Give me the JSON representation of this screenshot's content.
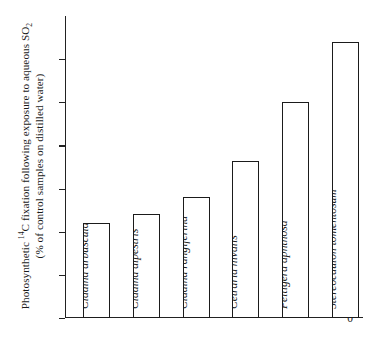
{
  "chart_data": {
    "type": "bar",
    "title": "",
    "xlabel": "",
    "ylabel_line1_prefix": "Photosynthetic ",
    "ylabel_line1_sup": "14",
    "ylabel_line1_mid": "C fixation following exposure to aqueous SO",
    "ylabel_line1_sub": "2",
    "ylabel_line2": "(% of control samples on distilled water)",
    "ylabel_plain": "Photosynthetic 14C fixation following exposure to aqueous SO2 (% of control samples on distilled water)",
    "categories": [
      "Cladina arbuscula",
      "Cladina alpestris",
      "Cladina rangiferina",
      "Cetraria nivalis",
      "Peltigera aphthosa",
      "Stereocaulon tomentosum"
    ],
    "values": [
      44,
      48,
      56,
      73,
      100,
      128
    ],
    "ylim": [
      0,
      140
    ],
    "yticks": [
      0,
      20,
      40,
      60,
      80,
      100,
      120
    ],
    "ytick_labels": [
      "0",
      "20",
      "40",
      "60",
      "80",
      "100",
      "120"
    ],
    "grid": false,
    "legend": "none",
    "bar_fill": "#ffffff",
    "bar_edge": "#1b1b1b",
    "axis_color": "#222222"
  }
}
